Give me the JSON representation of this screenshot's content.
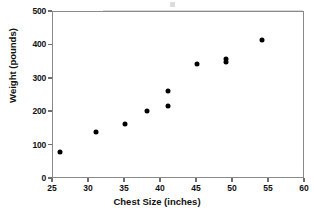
{
  "chart_data": {
    "type": "scatter",
    "title": "",
    "xlabel": "Chest Size (inches)",
    "ylabel": "Weight (pounds)",
    "xlim": [
      25,
      60
    ],
    "ylim": [
      0,
      500
    ],
    "xticks": [
      25,
      30,
      35,
      40,
      45,
      50,
      55,
      60
    ],
    "yticks": [
      0,
      100,
      200,
      300,
      400,
      500
    ],
    "grid": false,
    "legend": null,
    "marker_color": "#000000",
    "axis_color": "#8a8a8a",
    "points": [
      {
        "x": 26,
        "y": 80
      },
      {
        "x": 31,
        "y": 142
      },
      {
        "x": 35,
        "y": 165
      },
      {
        "x": 38,
        "y": 205
      },
      {
        "x": 41,
        "y": 220
      },
      {
        "x": 41,
        "y": 262
      },
      {
        "x": 45,
        "y": 345
      },
      {
        "x": 49,
        "y": 350
      },
      {
        "x": 49,
        "y": 360
      },
      {
        "x": 54,
        "y": 415
      }
    ]
  }
}
